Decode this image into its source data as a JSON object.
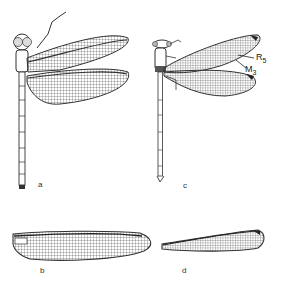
{
  "figure": {
    "panels": [
      {
        "id": "a",
        "label": "a",
        "subject": "dragonfly-full-body"
      },
      {
        "id": "b",
        "label": "b",
        "subject": "dragonfly-wing"
      },
      {
        "id": "c",
        "label": "c",
        "subject": "damselfly-full-body"
      },
      {
        "id": "d",
        "label": "d",
        "subject": "damselfly-wing"
      }
    ],
    "vein_labels": [
      {
        "base": "R",
        "sub": "5"
      },
      {
        "base": "M",
        "sub": "3"
      }
    ]
  },
  "colors": {
    "ink": "#2a2a2a",
    "paper": "#ffffff"
  }
}
